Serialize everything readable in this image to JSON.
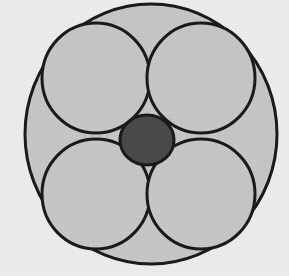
{
  "figure": {
    "title": "Circle packing: four equal circles inscribed in a larger circle with a central circle",
    "domain": "Diagram",
    "canvas": {
      "width": 289,
      "height": 276
    },
    "background_color": "#efefef",
    "stroke_color": "#1a1a1a",
    "fill_light_gray": "#c8c8c8",
    "fill_dark_gray": "#4a4a4a"
  },
  "shapes": {
    "outer_circle": {
      "label": "outer enclosing circle",
      "cx": 151,
      "cy": 134,
      "rx": 126,
      "ry": 130,
      "fill": "#c8c8c8",
      "stroke": "#1a1a1a",
      "stroke_width": 3
    },
    "inner_circles": [
      {
        "label": "top-left circle",
        "cx": 96,
        "cy": 78,
        "rx": 54,
        "ry": 55,
        "fill": "#c8c8c8",
        "stroke": "#1a1a1a",
        "stroke_width": 3
      },
      {
        "label": "top-right circle",
        "cx": 201,
        "cy": 78,
        "rx": 54,
        "ry": 55,
        "fill": "#c8c8c8",
        "stroke": "#1a1a1a",
        "stroke_width": 3
      },
      {
        "label": "bottom-left circle",
        "cx": 96,
        "cy": 194,
        "rx": 54,
        "ry": 55,
        "fill": "#c8c8c8",
        "stroke": "#1a1a1a",
        "stroke_width": 3
      },
      {
        "label": "bottom-right circle",
        "cx": 201,
        "cy": 194,
        "rx": 54,
        "ry": 55,
        "fill": "#c8c8c8",
        "stroke": "#1a1a1a",
        "stroke_width": 3
      }
    ],
    "center_circle": {
      "label": "central dark circle",
      "cx": 147,
      "cy": 140,
      "rx": 27,
      "ry": 25,
      "fill": "#4a4a4a",
      "stroke": "#1a1a1a",
      "stroke_width": 3
    }
  },
  "labels": {
    "none_visible": ""
  }
}
